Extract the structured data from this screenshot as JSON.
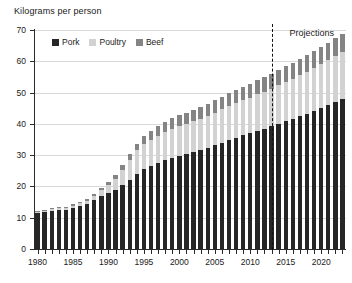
{
  "chart_data": {
    "type": "bar",
    "stacked": true,
    "title": "",
    "ylabel": "Kilograms per person",
    "xlabel": "",
    "ylim": [
      0,
      70
    ],
    "ytick_values": [
      0,
      10,
      20,
      30,
      40,
      50,
      60,
      70
    ],
    "xtick_labels": [
      "1980",
      "1985",
      "1990",
      "1995",
      "2000",
      "2005",
      "2010",
      "2015",
      "2020"
    ],
    "grid": true,
    "legend_position": "top-left",
    "legend": [
      "Pork",
      "Poultry",
      "Beef"
    ],
    "colors": {
      "pork": "#262626",
      "poultry": "#d2d2d2",
      "beef": "#848484",
      "axis": "#2a2a2a",
      "grid": "#d9d9d9",
      "text": "#1a1a1a"
    },
    "annotations": [
      {
        "text": "Projections",
        "x": 2013
      }
    ],
    "divider_after_year": 2013,
    "categories": [
      1980,
      1981,
      1982,
      1983,
      1984,
      1985,
      1986,
      1987,
      1988,
      1989,
      1990,
      1991,
      1992,
      1993,
      1994,
      1995,
      1996,
      1997,
      1998,
      1999,
      2000,
      2001,
      2002,
      2003,
      2004,
      2005,
      2006,
      2007,
      2008,
      2009,
      2010,
      2011,
      2012,
      2013,
      2014,
      2015,
      2016,
      2017,
      2018,
      2019,
      2020,
      2021,
      2022,
      2023
    ],
    "series": [
      {
        "name": "Pork",
        "values": [
          11.5,
          11.8,
          12.2,
          12.5,
          12.6,
          13.2,
          13.8,
          14.5,
          15.6,
          16.8,
          17.8,
          19.0,
          20.6,
          22.0,
          24.0,
          25.5,
          26.5,
          27.5,
          28.4,
          29.2,
          29.8,
          30.4,
          31.0,
          31.6,
          32.4,
          33.2,
          34.0,
          34.8,
          35.6,
          36.3,
          37.0,
          37.8,
          38.5,
          39.2,
          40.0,
          40.8,
          41.6,
          42.4,
          43.2,
          44.0,
          45.0,
          46.0,
          47.0,
          48.0
        ]
      },
      {
        "name": "Poultry",
        "values": [
          0.4,
          0.4,
          0.5,
          0.5,
          0.6,
          0.7,
          0.8,
          1.0,
          1.5,
          2.0,
          2.6,
          3.5,
          4.8,
          6.5,
          7.5,
          8.0,
          8.4,
          8.7,
          9.0,
          9.2,
          9.4,
          9.6,
          9.8,
          10.0,
          10.2,
          10.4,
          10.6,
          10.8,
          11.0,
          11.2,
          11.4,
          11.6,
          11.8,
          12.0,
          12.3,
          12.6,
          12.9,
          13.2,
          13.5,
          13.8,
          14.1,
          14.4,
          14.7,
          15.0
        ]
      },
      {
        "name": "Beef",
        "values": [
          0.3,
          0.3,
          0.3,
          0.3,
          0.3,
          0.4,
          0.4,
          0.5,
          0.6,
          0.7,
          0.9,
          1.1,
          1.4,
          1.8,
          2.2,
          2.6,
          2.9,
          3.1,
          3.3,
          3.4,
          3.5,
          3.6,
          3.7,
          3.8,
          3.9,
          4.0,
          4.1,
          4.2,
          4.3,
          4.4,
          4.5,
          4.6,
          4.7,
          4.8,
          4.9,
          5.0,
          5.1,
          5.2,
          5.3,
          5.4,
          5.5,
          5.6,
          5.7,
          5.8
        ]
      }
    ]
  }
}
